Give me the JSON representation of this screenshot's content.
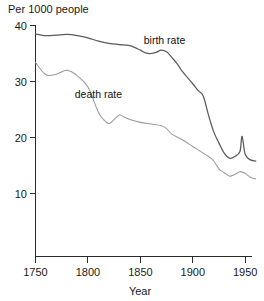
{
  "chart_data": {
    "type": "line",
    "title": "Per 1000 people",
    "xlabel": "Year",
    "ylabel": "",
    "xlim": [
      1750,
      1960
    ],
    "ylim": [
      0,
      40
    ],
    "grid": false,
    "legend_position": "inline-annotation",
    "x_ticks": [
      "1750",
      "1800",
      "1850",
      "1900",
      "1950"
    ],
    "x_tick_values": [
      1750,
      1800,
      1850,
      1900,
      1950
    ],
    "y_ticks": [
      "10",
      "20",
      "30",
      "40"
    ],
    "y_tick_values": [
      10,
      20,
      30,
      40
    ],
    "series": [
      {
        "name": "birth rate",
        "label": "birth rate",
        "color": "#5a5a5a",
        "label_x": 1873,
        "label_y": 36.7,
        "x": [
          1750,
          1760,
          1770,
          1780,
          1790,
          1800,
          1810,
          1820,
          1830,
          1840,
          1850,
          1855,
          1860,
          1865,
          1870,
          1875,
          1880,
          1885,
          1890,
          1895,
          1900,
          1905,
          1910,
          1915,
          1920,
          1925,
          1930,
          1935,
          1940,
          1945,
          1947,
          1950,
          1955,
          1960
        ],
        "values": [
          38.5,
          38.2,
          38.3,
          38.4,
          38.2,
          37.8,
          37.2,
          36.8,
          36.6,
          36.4,
          35.6,
          35.1,
          35.0,
          35.2,
          35.6,
          35.3,
          34.3,
          33.2,
          31.8,
          30.7,
          29.6,
          28.4,
          27.4,
          24.0,
          21.0,
          19.0,
          17.2,
          16.3,
          16.6,
          17.5,
          20.2,
          17.0,
          16.0,
          15.8
        ]
      },
      {
        "name": "death rate",
        "label": "death rate",
        "color": "#9a9a9a",
        "label_x": 1810,
        "label_y": 27.0,
        "x": [
          1750,
          1760,
          1770,
          1780,
          1790,
          1800,
          1810,
          1815,
          1820,
          1825,
          1830,
          1835,
          1840,
          1850,
          1860,
          1870,
          1875,
          1880,
          1890,
          1900,
          1910,
          1915,
          1920,
          1925,
          1930,
          1935,
          1940,
          1945,
          1950,
          1955,
          1960
        ],
        "values": [
          33.4,
          31.2,
          31.3,
          32.0,
          31.0,
          29.0,
          24.5,
          23.2,
          22.5,
          23.2,
          24.0,
          23.6,
          23.2,
          22.7,
          22.4,
          22.1,
          21.6,
          20.6,
          19.6,
          18.4,
          17.2,
          16.6,
          15.8,
          14.4,
          13.7,
          13.1,
          13.4,
          13.9,
          13.6,
          12.9,
          12.6
        ]
      }
    ]
  }
}
